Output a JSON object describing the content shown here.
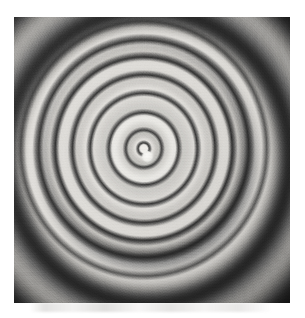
{
  "page": {
    "background_color": "#ffffff",
    "width": 305,
    "height": 318,
    "caption": ""
  },
  "figure": {
    "title": "",
    "description": "Grayscale photographic plate of a circular interference fringe pattern (concentric Newton's rings / Fabry-Perot fringes)",
    "plate": {
      "left": 14,
      "top": 17,
      "width": 276,
      "height": 286,
      "background_color": "#1b1b1b",
      "border_color": "#ffffff"
    },
    "artifacts": {
      "scan_smudge_label": "faint grey scan smudge below plate",
      "film_grain_label": "film grain speckle"
    }
  },
  "chart_data": {
    "type": "heatmap",
    "title": "Circular interference fringe pattern",
    "subtitle": "Concentric dark/bright rings on photographic plate",
    "xlabel": "",
    "ylabel": "",
    "grid": false,
    "legend": "none",
    "center": {
      "x": 152,
      "y": 160
    },
    "center_spot_radius_px": 4,
    "ellipticity_x_scale": 0.965,
    "pattern_rotation_deg": -1.2,
    "xlim": [
      14,
      290
    ],
    "ylim": [
      17,
      303
    ],
    "intensity_levels": {
      "outer_background": "#1b1b1b",
      "dark_fringe": "#2a2a2a",
      "mid_gray_band": "#a8a6a2",
      "bright_band": "#e6e4e0",
      "center_spot": "#fbfaf8",
      "sharp_line": "#2c2c2c"
    },
    "dark_ring_radii_px": [
      6,
      18,
      36,
      55,
      74,
      92,
      109,
      127,
      143,
      175,
      208,
      243
    ],
    "bright_ring_radii_px": [
      0,
      12,
      27,
      46,
      65,
      83,
      100,
      118,
      135,
      160,
      192,
      226
    ],
    "ring_orders": [
      1,
      2,
      3,
      4,
      5,
      6,
      7,
      8,
      9,
      10,
      11,
      12
    ],
    "sharpness_note": "inner fringes are thin and sharp; outer fringes broaden and blur into the dark background",
    "annotations": []
  }
}
